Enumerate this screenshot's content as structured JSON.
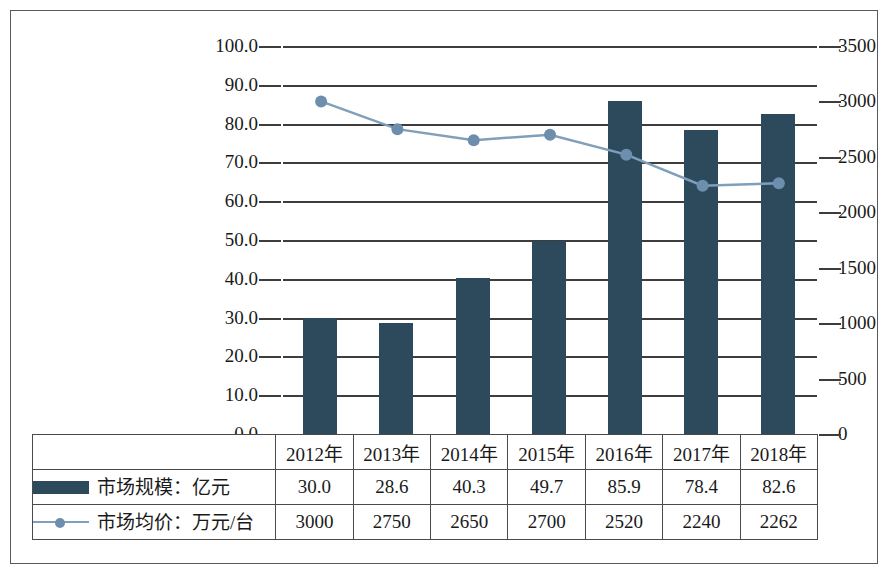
{
  "chart_data": {
    "type": "bar",
    "title": "",
    "xlabel": "",
    "ylabel": "",
    "grid": true,
    "legend_position": "bottom-table",
    "categories": [
      "2012年",
      "2013年",
      "2014年",
      "2015年",
      "2016年",
      "2017年",
      "2018年"
    ],
    "series": [
      {
        "name": "市场规模：亿元",
        "type": "bar",
        "axis": "left",
        "color": "#2d4a5c",
        "values": [
          30.0,
          28.6,
          40.3,
          49.7,
          85.9,
          78.4,
          82.6
        ],
        "value_labels": [
          "30.0",
          "28.6",
          "40.3",
          "49.7",
          "85.9",
          "78.4",
          "82.6"
        ]
      },
      {
        "name": "市场均价：万元/台",
        "type": "line",
        "axis": "right",
        "color": "#6d8fad",
        "values": [
          3000,
          2750,
          2650,
          2700,
          2520,
          2240,
          2262
        ],
        "value_labels": [
          "3000",
          "2750",
          "2650",
          "2700",
          "2520",
          "2240",
          "2262"
        ]
      }
    ],
    "left_axis": {
      "min": 0.0,
      "max": 100.0,
      "step": 10.0,
      "ticks": [
        "0.0",
        "10.0",
        "20.0",
        "30.0",
        "40.0",
        "50.0",
        "60.0",
        "70.0",
        "80.0",
        "90.0",
        "100.0"
      ]
    },
    "right_axis": {
      "min": 0,
      "max": 3500,
      "step": 500,
      "ticks": [
        "0",
        "500",
        "1000",
        "1500",
        "2000",
        "2500",
        "3000",
        "3500"
      ]
    }
  },
  "table": {
    "header_row": [
      "2012年",
      "2013年",
      "2014年",
      "2015年",
      "2016年",
      "2017年",
      "2018年"
    ],
    "rows": [
      {
        "legend_label": "市场规模：亿元",
        "marker": "bar-swatch",
        "cells": [
          "30.0",
          "28.6",
          "40.3",
          "49.7",
          "85.9",
          "78.4",
          "82.6"
        ]
      },
      {
        "legend_label": "市场均价：万元/台",
        "marker": "line-marker-swatch",
        "cells": [
          "3000",
          "2750",
          "2650",
          "2700",
          "2520",
          "2240",
          "2262"
        ]
      }
    ]
  },
  "colors": {
    "bar": "#2d4a5c",
    "line": "#6d8fad",
    "grid": "#3d3d3d",
    "frame": "#5a5a5a"
  }
}
